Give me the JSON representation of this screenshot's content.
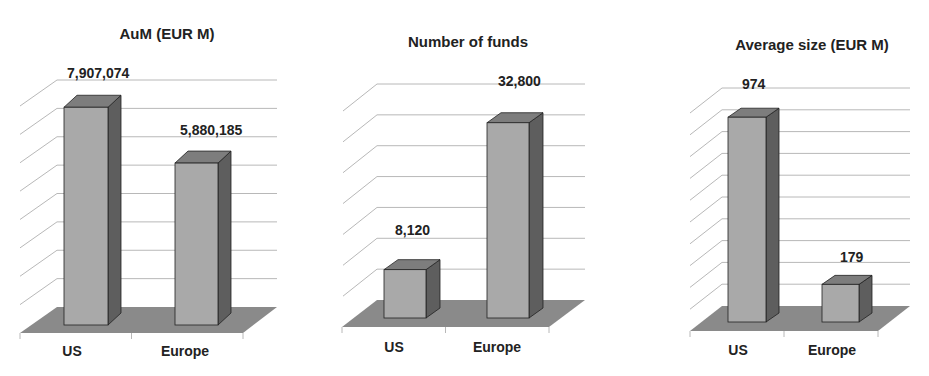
{
  "colors": {
    "bar_front": "#a9a9a9",
    "bar_top": "#7d7d7d",
    "bar_side": "#5e5e5e",
    "floor": "#8a8a8a",
    "grid": "#b8b8b8",
    "outline": "#222222",
    "text": "#222222"
  },
  "chart_data": [
    {
      "type": "bar",
      "title": "AuM (EUR M)",
      "categories": [
        "US",
        "Europe"
      ],
      "values": [
        7907074,
        5880185
      ],
      "value_labels": [
        "7,907,074",
        "5,880,185"
      ],
      "xlabel": "",
      "ylabel": "",
      "ylim": [
        0,
        8000000
      ],
      "grid": true,
      "gridlines": 8,
      "style": "3d-column"
    },
    {
      "type": "bar",
      "title": "Number of funds",
      "categories": [
        "US",
        "Europe"
      ],
      "values": [
        8120,
        32800
      ],
      "value_labels": [
        "8,120",
        "32,800"
      ],
      "xlabel": "",
      "ylabel": "",
      "ylim": [
        0,
        35000
      ],
      "grid": true,
      "gridlines": 7,
      "style": "3d-column"
    },
    {
      "type": "bar",
      "title": "Average size (EUR M)",
      "categories": [
        "US",
        "Europe"
      ],
      "values": [
        974,
        179
      ],
      "value_labels": [
        "974",
        "179"
      ],
      "xlabel": "",
      "ylabel": "",
      "ylim": [
        0,
        1000
      ],
      "grid": true,
      "gridlines": 10,
      "style": "3d-column"
    }
  ],
  "panels": [
    {
      "title": "AuM (EUR M)",
      "categories": [
        "US",
        "Europe"
      ],
      "value_labels": [
        "7,907,074",
        "5,880,185"
      ]
    },
    {
      "title": "Number of funds",
      "categories": [
        "US",
        "Europe"
      ],
      "value_labels": [
        "8,120",
        "32,800"
      ]
    },
    {
      "title": "Average size (EUR M)",
      "categories": [
        "US",
        "Europe"
      ],
      "value_labels": [
        "974",
        "179"
      ]
    }
  ]
}
